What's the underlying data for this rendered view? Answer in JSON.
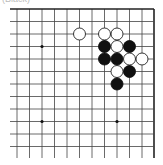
{
  "caption": "(Black)",
  "board": {
    "colors": {
      "background": "#ffffff",
      "line": "#444444",
      "border": "#222222",
      "black_stone": "#111111",
      "white_stone": "#ffffff",
      "white_stone_stroke": "#222222",
      "star_point": "#111111"
    },
    "x_lines": [
      17,
      29.5,
      42,
      54.5,
      67,
      79.5,
      92,
      104.5,
      117,
      129.5,
      142,
      154
    ],
    "y_lines": [
      9,
      21.5,
      34,
      46.5,
      59,
      71.5,
      84,
      96.5,
      109,
      121.5,
      134,
      146.5
    ],
    "line_extent": {
      "left": 10,
      "right": 154,
      "top": 9,
      "bottom": 158
    },
    "edges": {
      "top": true,
      "right": true,
      "left": false,
      "bottom": false
    },
    "stone_radius": 6,
    "star_points": [
      {
        "col": 2,
        "row": 3
      },
      {
        "col": 8,
        "row": 3
      },
      {
        "col": 2,
        "row": 9
      },
      {
        "col": 8,
        "row": 9
      }
    ],
    "stones": [
      {
        "color": "white",
        "col": 5,
        "row": 2
      },
      {
        "color": "white",
        "col": 7,
        "row": 2
      },
      {
        "color": "white",
        "col": 8,
        "row": 2
      },
      {
        "color": "black",
        "col": 7,
        "row": 3
      },
      {
        "color": "white",
        "col": 8,
        "row": 3
      },
      {
        "color": "black",
        "col": 9,
        "row": 3
      },
      {
        "color": "black",
        "col": 7,
        "row": 4
      },
      {
        "color": "black",
        "col": 8,
        "row": 4
      },
      {
        "color": "white",
        "col": 9,
        "row": 4
      },
      {
        "color": "white",
        "col": 10,
        "row": 4
      },
      {
        "color": "white",
        "col": 8,
        "row": 5
      },
      {
        "color": "black",
        "col": 9,
        "row": 5
      },
      {
        "color": "black",
        "col": 8,
        "row": 6
      }
    ]
  }
}
